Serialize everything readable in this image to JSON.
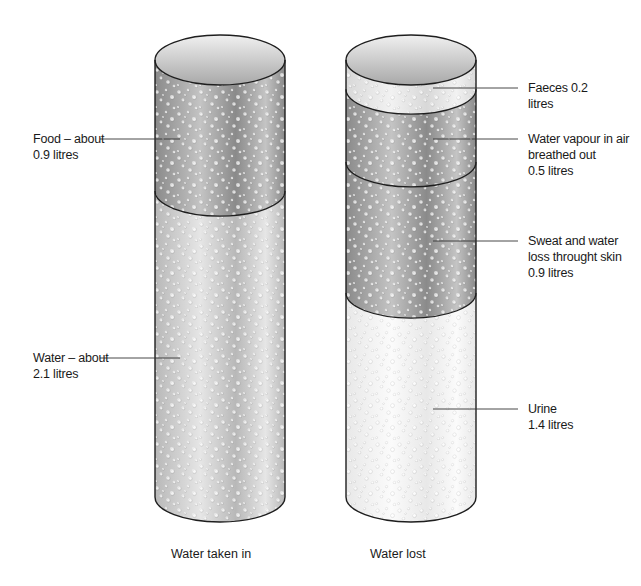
{
  "cylinders": [
    {
      "id": "water-taken-in",
      "caption": "Water taken in",
      "segments": [
        {
          "name": "food",
          "lines": [
            "Food – about",
            "0.9 litres"
          ],
          "litres": 0.9,
          "shade": "dark",
          "label_side": "left"
        },
        {
          "name": "water",
          "lines": [
            "Water – about",
            "2.1 litres"
          ],
          "litres": 2.1,
          "shade": "mid",
          "label_side": "left"
        }
      ]
    },
    {
      "id": "water-lost",
      "caption": "Water lost",
      "segments": [
        {
          "name": "faeces",
          "lines": [
            "Faeces  0.2",
            "litres"
          ],
          "litres": 0.2,
          "shade": "light",
          "label_side": "right"
        },
        {
          "name": "water-vapour",
          "lines": [
            "Water vapour in air",
            "breathed out",
            "0.5 litres"
          ],
          "litres": 0.5,
          "shade": "dark",
          "label_side": "right"
        },
        {
          "name": "sweat",
          "lines": [
            "Sweat and water",
            "loss throught skin",
            "0.9 litres"
          ],
          "litres": 0.9,
          "shade": "dark",
          "label_side": "right"
        },
        {
          "name": "urine",
          "lines": [
            "Urine",
            "1.4 litres"
          ],
          "litres": 1.4,
          "shade": "white",
          "label_side": "right"
        }
      ]
    }
  ],
  "colors": {
    "outline": "#1e1e1e",
    "leader": "#333333",
    "shade_dark_edge": "#8a8a8a",
    "shade_dark_mid": "#c4c4c4",
    "shade_mid_edge": "#b8b8b8",
    "shade_mid_mid": "#e6e6e6",
    "shade_light_edge": "#d8d8d8",
    "shade_light_mid": "#f2f2f2",
    "shade_white_edge": "#e8e8e8",
    "shade_white_mid": "#fbfbfb",
    "top_face_top": "#f0f0f0",
    "top_face_bottom": "#a8a8a8"
  }
}
